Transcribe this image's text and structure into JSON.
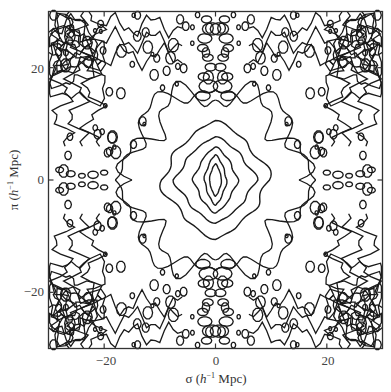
{
  "chart_data": {
    "type": "contour",
    "title": "",
    "xlabel": "σ (h⁻¹ Mpc)",
    "ylabel": "π (h⁻¹ Mpc)",
    "xlabel_parts": {
      "symbol": "σ",
      "unit_pre": "(",
      "h": "h",
      "exp": "−1",
      "unit_post": " Mpc)"
    },
    "ylabel_parts": {
      "symbol": "π",
      "unit_pre": "(",
      "h": "h",
      "exp": "−1",
      "unit_post": " Mpc)"
    },
    "xlim": [
      -30,
      30
    ],
    "ylim": [
      -30,
      30
    ],
    "xticks": [
      -20,
      0,
      20
    ],
    "yticks": [
      -20,
      0,
      20
    ],
    "xtick_labels": [
      "−20",
      "0",
      "20"
    ],
    "ytick_labels": [
      "−20",
      "0",
      "20"
    ],
    "grid": false,
    "legend": null,
    "symmetry": "mirror-symmetric about σ=0 and π=0",
    "central_contours": [
      {
        "level_index": 1,
        "sigma_halfwidth": 9.7,
        "pi_halfheight": 10.6,
        "wiggle": 0.9
      },
      {
        "level_index": 2,
        "sigma_halfwidth": 7.2,
        "pi_halfheight": 7.7,
        "wiggle": 0.5
      },
      {
        "level_index": 3,
        "sigma_halfwidth": 3.9,
        "pi_halfheight": 5.9,
        "wiggle": 0.3
      },
      {
        "level_index": 4,
        "sigma_halfwidth": 2.0,
        "pi_halfheight": 4.5,
        "wiggle": 0.15
      },
      {
        "level_index": 5,
        "sigma_halfwidth": 1.1,
        "pi_halfheight": 2.9,
        "wiggle": 0.05
      }
    ],
    "line_color": "#1a1a1a",
    "frame_color": "#333333"
  }
}
